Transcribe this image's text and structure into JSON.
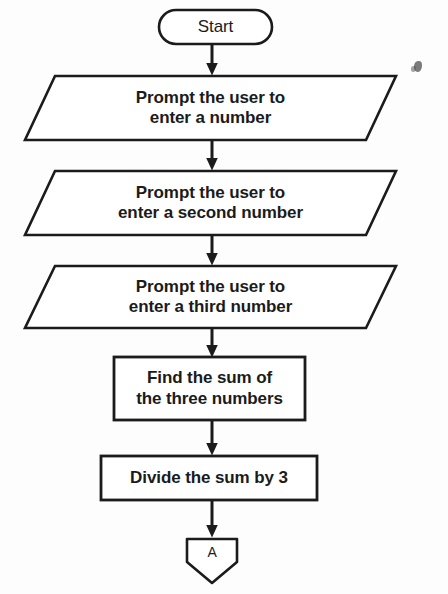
{
  "diagram": {
    "orientation": "vertical top-to-bottom",
    "stroke_color": "#1b1b1b",
    "fill_color": "#ffffff",
    "background_color": "#fdfdfd"
  },
  "nodes": {
    "start": {
      "shape": "terminator",
      "label": "Start"
    },
    "input_first": {
      "shape": "parallelogram",
      "line1": "Prompt the user to",
      "line2": "enter a number"
    },
    "input_second": {
      "shape": "parallelogram",
      "line1": "Prompt the user to",
      "line2": "enter a second number"
    },
    "input_third": {
      "shape": "parallelogram",
      "line1": "Prompt the user to",
      "line2": "enter a third number"
    },
    "find_sum": {
      "shape": "process",
      "line1": "Find the sum of",
      "line2": "the three numbers"
    },
    "divide_sum": {
      "shape": "process",
      "line1": "Divide the sum by 3"
    },
    "connector_a": {
      "shape": "off-page-connector",
      "label": "A"
    }
  },
  "connectors": [
    {
      "from": "start",
      "to": "input_first",
      "style": "arrow-down"
    },
    {
      "from": "input_first",
      "to": "input_second",
      "style": "arrow-down"
    },
    {
      "from": "input_second",
      "to": "input_third",
      "style": "arrow-down"
    },
    {
      "from": "input_third",
      "to": "find_sum",
      "style": "arrow-down"
    },
    {
      "from": "find_sum",
      "to": "divide_sum",
      "style": "arrow-down"
    },
    {
      "from": "divide_sum",
      "to": "connector_a",
      "style": "arrow-down"
    }
  ]
}
